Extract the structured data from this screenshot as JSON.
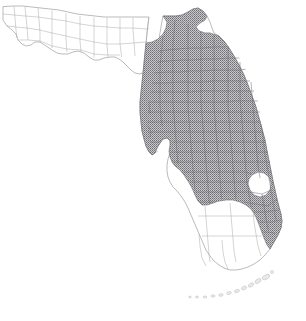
{
  "figure": {
    "kind": "choropleth-map",
    "caption": "",
    "region_name": "Florida",
    "background_color": "#ffffff"
  },
  "legend": {
    "shown": false,
    "entries": [
      {
        "label": "Shaded (present)",
        "color": "#9a9a9e",
        "pattern": "stipple"
      },
      {
        "label": "Unshaded (absent)",
        "color": "#ffffff",
        "pattern": "none"
      }
    ]
  },
  "map_style": {
    "outline_color": "#8d8d91",
    "county_line_color": "#a9a9ad",
    "shaded_fill": "#9a9a9e",
    "shaded_line_color": "#6e6e72",
    "lake_fill": "#ffffff",
    "keys_fill": "#e9e9ec"
  },
  "features": {
    "state_outline_label": "Florida state boundary",
    "county_lines_label": "County boundaries",
    "shaded_area_label": "Shaded peninsular area",
    "lake_label": "Lake Okeechobee",
    "keys_label": "Florida Keys"
  }
}
